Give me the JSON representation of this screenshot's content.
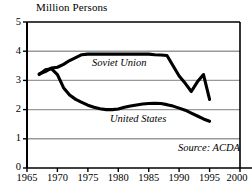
{
  "chart_data": {
    "type": "line",
    "title": "Million Persons",
    "xlabel": "",
    "ylabel": "Million Persons",
    "xlim": [
      1965,
      2000
    ],
    "ylim": [
      0,
      5
    ],
    "xticks": [
      "1965",
      "1970",
      "1975",
      "1980",
      "1985",
      "1990",
      "1995",
      "2000"
    ],
    "yticks": [
      "0",
      "1",
      "2",
      "3",
      "4",
      "5"
    ],
    "grid": "horizontal",
    "legend_position": "inline-annotation",
    "annotations": [
      "Soviet Union",
      "United States",
      "Source: ACDA"
    ],
    "line_color": "#000000",
    "grid_color": "#999999",
    "axis_color": "#000000",
    "background": "#ffffff",
    "series": [
      {
        "name": "Soviet Union",
        "x": [
          1967,
          1968,
          1969,
          1970,
          1971,
          1972,
          1973,
          1974,
          1975,
          1976,
          1977,
          1978,
          1979,
          1980,
          1981,
          1982,
          1983,
          1984,
          1985,
          1986,
          1987,
          1988,
          1989,
          1990,
          1991,
          1992,
          1993,
          1994,
          1995
        ],
        "values": [
          3.22,
          3.3,
          3.42,
          3.45,
          3.55,
          3.68,
          3.78,
          3.88,
          3.9,
          3.9,
          3.9,
          3.9,
          3.9,
          3.9,
          3.9,
          3.9,
          3.9,
          3.9,
          3.9,
          3.88,
          3.87,
          3.85,
          3.5,
          3.15,
          2.9,
          2.62,
          2.95,
          3.2,
          2.35
        ]
      },
      {
        "name": "United States",
        "x": [
          1967,
          1968,
          1969,
          1970,
          1971,
          1972,
          1973,
          1974,
          1975,
          1976,
          1977,
          1978,
          1979,
          1980,
          1981,
          1982,
          1983,
          1984,
          1985,
          1986,
          1987,
          1988,
          1989,
          1990,
          1991,
          1992,
          1993,
          1994,
          1995
        ],
        "values": [
          3.2,
          3.36,
          3.4,
          3.2,
          2.75,
          2.5,
          2.35,
          2.25,
          2.15,
          2.08,
          2.03,
          2.0,
          2.0,
          2.02,
          2.08,
          2.12,
          2.16,
          2.19,
          2.21,
          2.22,
          2.21,
          2.17,
          2.12,
          2.05,
          1.98,
          1.88,
          1.78,
          1.68,
          1.6
        ]
      }
    ]
  },
  "labels": {
    "soviet_union": "Soviet Union",
    "united_states": "United States",
    "source": "Source: ACDA"
  }
}
